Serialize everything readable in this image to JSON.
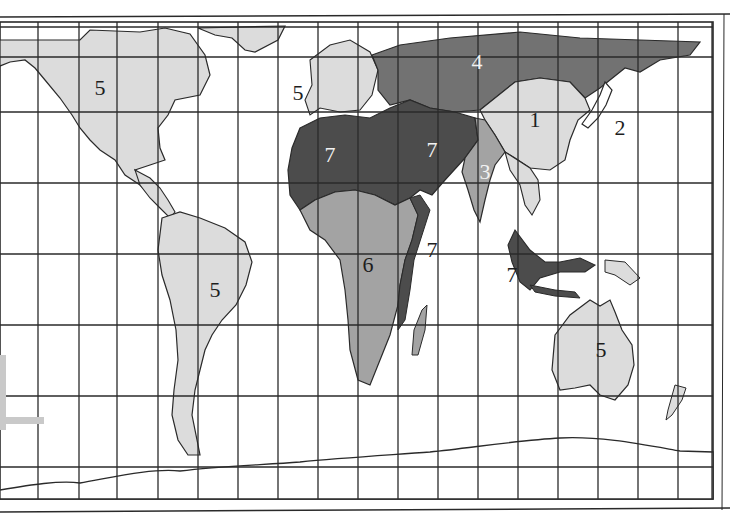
{
  "map": {
    "type": "world-region-map",
    "style": "grayscale",
    "colors": {
      "background": "#ffffff",
      "ocean": "#ffffff",
      "grid": "#2a2a2a",
      "border": "#2a2a2a",
      "shade_light": "#dcdcdc",
      "shade_medium": "#a3a3a3",
      "shade_dark": "#727272",
      "shade_darkest": "#4c4c4c"
    },
    "grid": {
      "verticals": [
        38,
        79,
        117,
        158,
        198,
        238,
        278,
        318,
        358,
        398,
        438,
        478,
        518,
        558,
        598,
        638,
        678,
        712
      ],
      "horizontals": [
        27,
        57,
        112,
        183,
        254,
        325,
        396,
        467
      ]
    },
    "regions": [
      {
        "id": "north-america",
        "label": "5",
        "shade": "light",
        "x": 100,
        "y": 88,
        "label_color": "dark"
      },
      {
        "id": "europe",
        "label": "5",
        "shade": "light",
        "x": 298,
        "y": 93,
        "label_color": "dark"
      },
      {
        "id": "russia",
        "label": "4",
        "shade": "dark",
        "x": 477,
        "y": 62,
        "label_color": "light"
      },
      {
        "id": "china",
        "label": "1",
        "shade": "light",
        "x": 535,
        "y": 120,
        "label_color": "dark"
      },
      {
        "id": "japan",
        "label": "2",
        "shade": "none",
        "x": 620,
        "y": 128,
        "label_color": "dark"
      },
      {
        "id": "north-africa",
        "label": "7",
        "shade": "darkest",
        "x": 330,
        "y": 155,
        "label_color": "light"
      },
      {
        "id": "middle-east",
        "label": "7",
        "shade": "darkest",
        "x": 432,
        "y": 150,
        "label_color": "light"
      },
      {
        "id": "india",
        "label": "3",
        "shade": "medium",
        "x": 485,
        "y": 172,
        "label_color": "light"
      },
      {
        "id": "east-africa-coast",
        "label": "7",
        "shade": "darkest",
        "x": 432,
        "y": 250,
        "label_color": "dark"
      },
      {
        "id": "sub-saharan-africa",
        "label": "6",
        "shade": "medium",
        "x": 368,
        "y": 265,
        "label_color": "dark"
      },
      {
        "id": "indonesia",
        "label": "7",
        "shade": "darkest",
        "x": 512,
        "y": 275,
        "label_color": "dark"
      },
      {
        "id": "south-america",
        "label": "5",
        "shade": "light",
        "x": 215,
        "y": 290,
        "label_color": "dark"
      },
      {
        "id": "australia",
        "label": "5",
        "shade": "light",
        "x": 601,
        "y": 350,
        "label_color": "dark"
      }
    ]
  }
}
